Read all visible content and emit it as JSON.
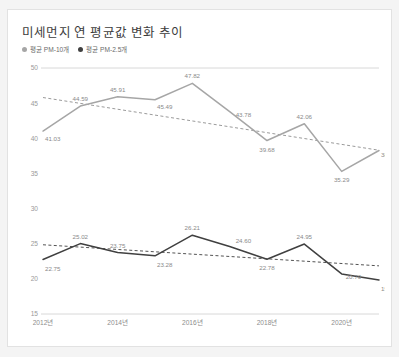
{
  "card": {
    "title": "미세먼지 연 평균값 변화 추이"
  },
  "legend": {
    "items": [
      {
        "label": "평균 PM-10개",
        "color": "#a6a6a6",
        "icon": "legend-dot-icon"
      },
      {
        "label": "평균 PM-2.5개",
        "color": "#404040",
        "icon": "legend-dot-icon"
      }
    ]
  },
  "chart_data": {
    "type": "line",
    "title": "미세먼지 연 평균값 변화 추이",
    "xlabel": "",
    "ylabel": "",
    "x": [
      "2012년",
      "2013년",
      "2014년",
      "2015년",
      "2016년",
      "2017년",
      "2018년",
      "2019년",
      "2020년",
      "2021년"
    ],
    "xtick_labels": [
      "2012년",
      "2014년",
      "2016년",
      "2018년",
      "2020년"
    ],
    "xtick_indices": [
      0,
      2,
      4,
      6,
      8
    ],
    "ylim": [
      15,
      50
    ],
    "ytick_labels": [
      "15",
      "20",
      "25",
      "30",
      "35",
      "40",
      "45",
      "50"
    ],
    "yticks": [
      15,
      20,
      25,
      30,
      35,
      40,
      45,
      50
    ],
    "grid": false,
    "legend_position": "top-left",
    "series": [
      {
        "name": "평균 PM-10개",
        "color": "#a6a6a6",
        "values": [
          41.03,
          44.59,
          45.91,
          45.49,
          47.82,
          43.78,
          39.68,
          42.06,
          35.29,
          38.26
        ],
        "labels": [
          "41.03",
          "44.59",
          "45.91",
          "45.49",
          "47.82",
          "43.78",
          "39.68",
          "42.06",
          "35.29",
          "38.26"
        ],
        "trendline": {
          "style": "dashed",
          "color": "#8e8e8e",
          "start": 45.8,
          "end": 38.3
        }
      },
      {
        "name": "평균 PM-2.5개",
        "color": "#404040",
        "values": [
          22.75,
          25.02,
          23.75,
          23.28,
          26.21,
          24.6,
          22.78,
          24.95,
          20.7,
          19.84
        ],
        "labels": [
          "22.75",
          "25.02",
          "23.75",
          "23.28",
          "26.21",
          "24.60",
          "22.78",
          "24.95",
          "20.70",
          "19.84"
        ],
        "trendline": {
          "style": "dashed",
          "color": "#3f3f3f",
          "start": 24.85,
          "end": 21.85
        }
      }
    ]
  }
}
